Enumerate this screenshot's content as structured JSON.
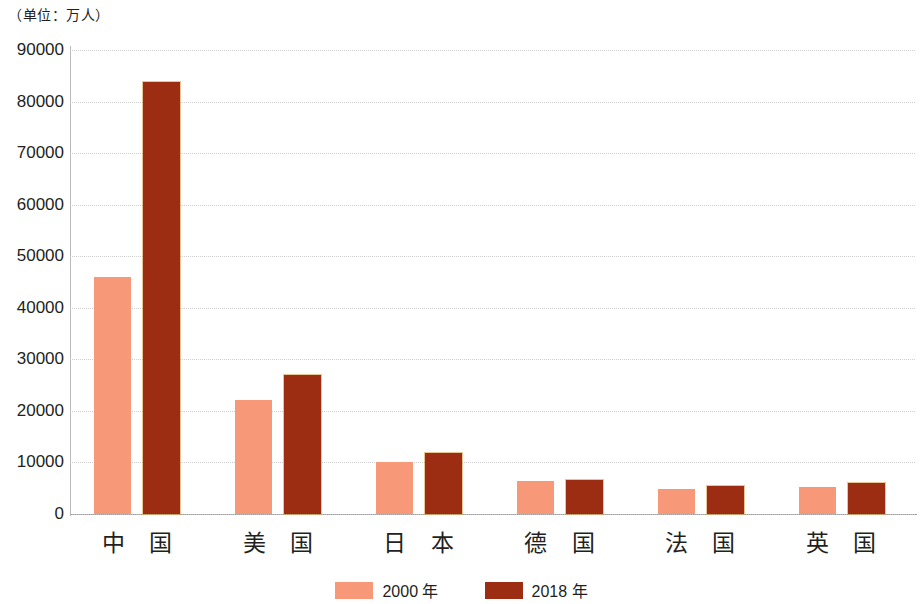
{
  "unit_caption": "（单位：万人）",
  "legend": {
    "position": "bottom-center",
    "items": [
      {
        "key": "series_a",
        "label": "2000 年",
        "color": "#f79878"
      },
      {
        "key": "series_b",
        "label": "2018 年",
        "color": "#9c2c12"
      }
    ]
  },
  "axis": {
    "y_ticks": [
      "90000",
      "80000",
      "70000",
      "60000",
      "50000",
      "40000",
      "30000",
      "20000",
      "10000",
      "0"
    ]
  },
  "chart_data": {
    "type": "bar",
    "title": "",
    "subtitle": "",
    "xlabel": "",
    "ylabel": "（单位：万人）",
    "ylim": [
      0,
      90000
    ],
    "ytick_interval": 10000,
    "yticks": [
      0,
      10000,
      20000,
      30000,
      40000,
      50000,
      60000,
      70000,
      80000,
      90000
    ],
    "grid": true,
    "grid_axis": "y",
    "legend_position": "bottom-center",
    "categories": [
      "中 国",
      "美 国",
      "日 本",
      "德 国",
      "法 国",
      "英 国"
    ],
    "series": [
      {
        "name": "2000 年",
        "color": "#f79878",
        "values": [
          46000,
          22200,
          10100,
          6400,
          4800,
          5200
        ]
      },
      {
        "name": "2018 年",
        "color": "#9c2c12",
        "values": [
          83700,
          27000,
          11900,
          6600,
          5500,
          6000
        ]
      }
    ]
  }
}
